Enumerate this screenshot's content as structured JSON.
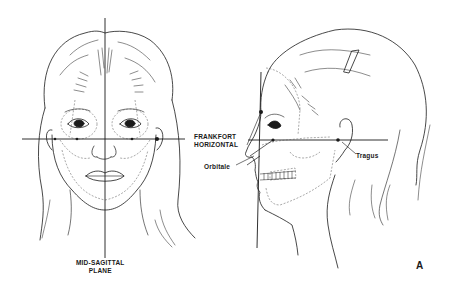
{
  "figure": {
    "panel_letter": "A",
    "labels": {
      "frankfort_line1": "FRANKFORT",
      "frankfort_line2": "HORIZONTAL",
      "midsagittal_line1": "MID-SAGITTAL",
      "midsagittal_line2": "PLANE",
      "orbitale": "Orbitale",
      "tragus": "Tragus"
    },
    "views": [
      {
        "name": "frontal-view",
        "description": "Front view of a female face with mid-sagittal plane and Frankfort horizontal line"
      },
      {
        "name": "lateral-view",
        "description": "Profile view of a female head with hair clip, showing Frankfort horizontal through orbitale and tragus"
      }
    ],
    "colors": {
      "ink": "#1a1a1a",
      "dashed": "#555555",
      "background": "#ffffff"
    }
  }
}
